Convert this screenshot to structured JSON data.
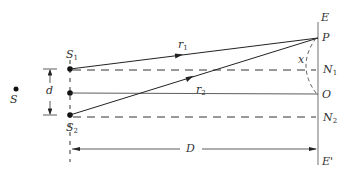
{
  "diagram": {
    "type": "young-double-slit-geometry",
    "labels": {
      "source": "S",
      "slit1": {
        "base": "S",
        "sub": "1"
      },
      "slit2": {
        "base": "S",
        "sub": "2"
      },
      "slit_separation": "d",
      "ray1": {
        "base": "r",
        "sub": "1"
      },
      "ray2": {
        "base": "r",
        "sub": "2"
      },
      "screen_top": "E",
      "screen_bottom": "E'",
      "point_p": "P",
      "n1": {
        "base": "N",
        "sub": "1"
      },
      "n2": {
        "base": "N",
        "sub": "2"
      },
      "center": "O",
      "x": "x",
      "distance": "D"
    },
    "colors": {
      "line": "#222222",
      "screen": "#888888",
      "text": "#333333"
    }
  }
}
